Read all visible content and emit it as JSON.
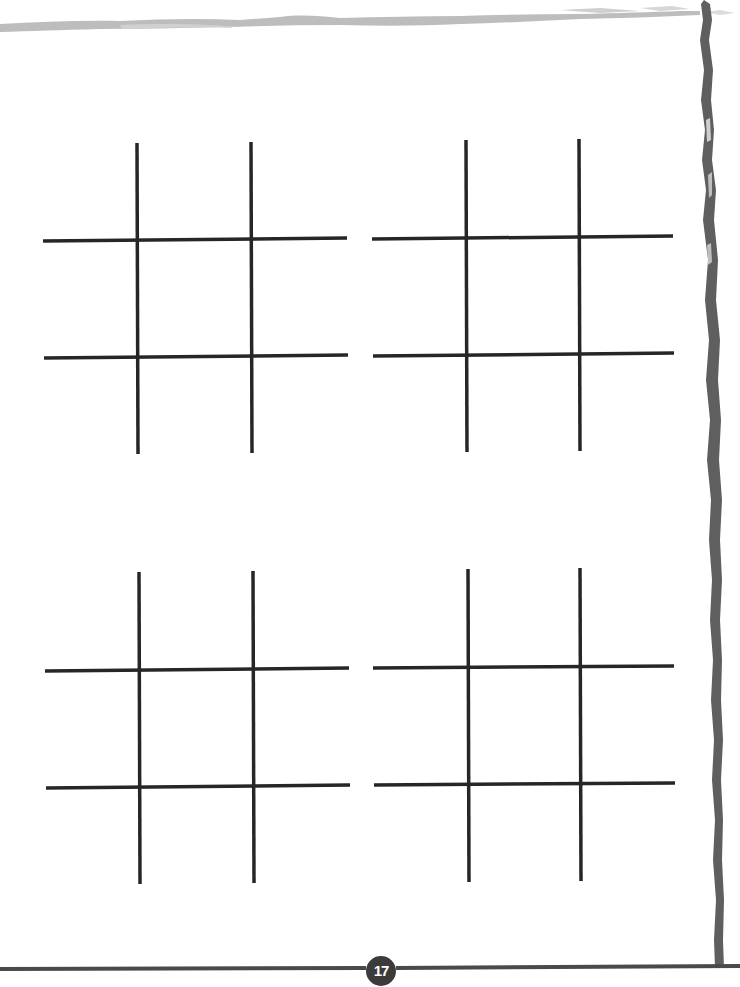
{
  "page": {
    "type": "Tic-tac-toe worksheet",
    "page_number": "17",
    "colors": {
      "background": "#ffffff",
      "grid_line": "#262626",
      "top_brush": "#bdbdbd",
      "right_brush": "#5f5f5f",
      "bottom_rule": "#4a4a4a",
      "page_badge": "#3b3b3b"
    }
  },
  "grids": [
    {
      "name": "top-left",
      "verticals": [
        {
          "x1": 137,
          "y1": 143,
          "x2": 138,
          "y2": 454
        },
        {
          "x1": 251,
          "y1": 142,
          "x2": 252,
          "y2": 453
        }
      ],
      "horizontals": [
        {
          "x1": 43,
          "y1": 241,
          "x2": 347,
          "y2": 238
        },
        {
          "x1": 44,
          "y1": 358,
          "x2": 348,
          "y2": 355
        }
      ]
    },
    {
      "name": "top-right",
      "verticals": [
        {
          "x1": 466,
          "y1": 140,
          "x2": 467,
          "y2": 452
        },
        {
          "x1": 579,
          "y1": 139,
          "x2": 580,
          "y2": 451
        }
      ],
      "horizontals": [
        {
          "x1": 372,
          "y1": 239,
          "x2": 673,
          "y2": 236
        },
        {
          "x1": 373,
          "y1": 356,
          "x2": 674,
          "y2": 353
        }
      ]
    },
    {
      "name": "bottom-left",
      "verticals": [
        {
          "x1": 139,
          "y1": 572,
          "x2": 140,
          "y2": 884
        },
        {
          "x1": 253,
          "y1": 571,
          "x2": 254,
          "y2": 883
        }
      ],
      "horizontals": [
        {
          "x1": 45,
          "y1": 671,
          "x2": 349,
          "y2": 668
        },
        {
          "x1": 46,
          "y1": 788,
          "x2": 350,
          "y2": 785
        }
      ]
    },
    {
      "name": "bottom-right",
      "verticals": [
        {
          "x1": 468,
          "y1": 569,
          "x2": 469,
          "y2": 882
        },
        {
          "x1": 580,
          "y1": 568,
          "x2": 581,
          "y2": 881
        }
      ],
      "horizontals": [
        {
          "x1": 373,
          "y1": 668,
          "x2": 674,
          "y2": 666
        },
        {
          "x1": 374,
          "y1": 785,
          "x2": 675,
          "y2": 783
        }
      ]
    }
  ]
}
